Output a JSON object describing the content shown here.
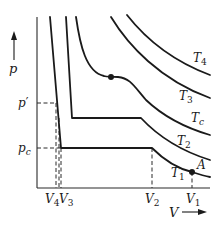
{
  "diagram": {
    "axes": {
      "y_label": "p",
      "x_label": "V",
      "y_ticks": [
        {
          "main": "p",
          "sup": "′",
          "sub": ""
        },
        {
          "main": "p",
          "sup": "",
          "sub": "c"
        }
      ],
      "x_ticks": [
        {
          "main": "V",
          "sub": "4"
        },
        {
          "main": "V",
          "sub": "3"
        },
        {
          "main": "V",
          "sub": "2"
        },
        {
          "main": "V",
          "sub": "1"
        }
      ]
    },
    "isotherms": [
      {
        "name": "T",
        "sub": "1"
      },
      {
        "name": "T",
        "sub": "2"
      },
      {
        "name": "T",
        "sub": "c"
      },
      {
        "name": "T",
        "sub": "3"
      },
      {
        "name": "T",
        "sub": "4"
      }
    ],
    "points": {
      "state_A": "A",
      "critical_point": ""
    },
    "colors": {
      "ink": "#1a1a1a",
      "background": "#ffffff"
    }
  }
}
